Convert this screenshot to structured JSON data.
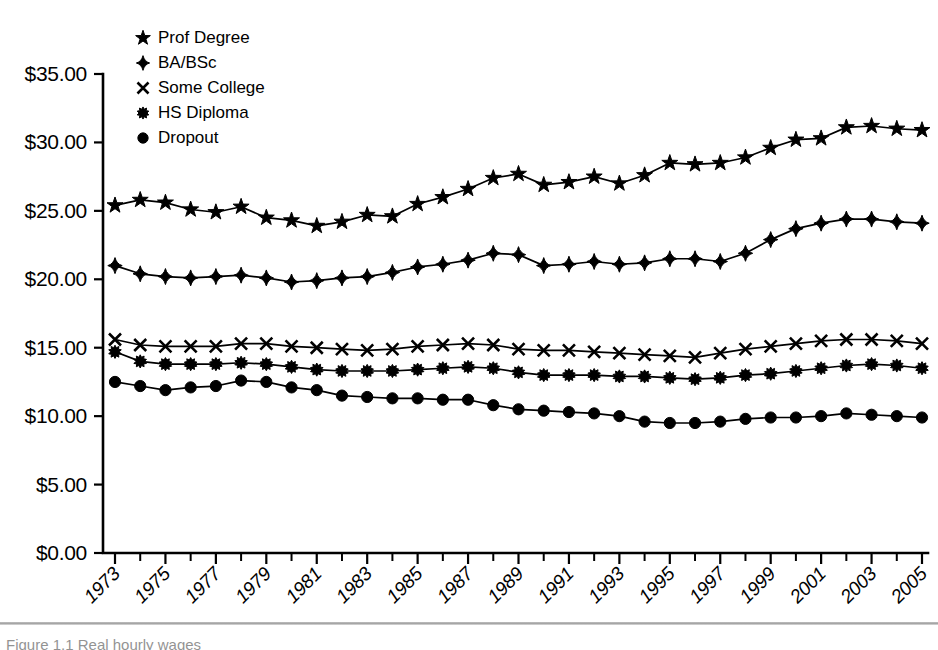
{
  "chart_data": {
    "type": "line",
    "title": "",
    "subtitle": "",
    "xlabel": "",
    "ylabel": "",
    "grid": false,
    "legend_position": "top-left",
    "ylim": [
      0,
      35
    ],
    "ytick_values": [
      0,
      5,
      10,
      15,
      20,
      25,
      30,
      35
    ],
    "ytick_labels": [
      "$0.00",
      "$5.00",
      "$10.00",
      "$15.00",
      "$20.00",
      "$25.00",
      "$30.00",
      "$35.00"
    ],
    "xlim": [
      1973,
      2005
    ],
    "x": [
      1973,
      1974,
      1975,
      1976,
      1977,
      1978,
      1979,
      1980,
      1981,
      1982,
      1983,
      1984,
      1985,
      1986,
      1987,
      1988,
      1989,
      1990,
      1991,
      1992,
      1993,
      1994,
      1995,
      1996,
      1997,
      1998,
      1999,
      2000,
      2001,
      2002,
      2003,
      2004,
      2005
    ],
    "xtick_labels": [
      "1973",
      "1975",
      "1977",
      "1979",
      "1981",
      "1983",
      "1985",
      "1987",
      "1989",
      "1991",
      "1993",
      "1995",
      "1997",
      "1999",
      "2001",
      "2003",
      "2005"
    ],
    "xtick_values": [
      1973,
      1975,
      1977,
      1979,
      1981,
      1983,
      1985,
      1987,
      1989,
      1991,
      1993,
      1995,
      1997,
      1999,
      2001,
      2003,
      2005
    ],
    "series": [
      {
        "name": "Prof Degree",
        "marker": "star",
        "values": [
          25.4,
          25.8,
          25.6,
          25.1,
          24.9,
          25.3,
          24.5,
          24.3,
          23.9,
          24.2,
          24.7,
          24.6,
          25.5,
          26.0,
          26.6,
          27.4,
          27.7,
          26.9,
          27.1,
          27.5,
          27.0,
          27.6,
          28.5,
          28.4,
          28.5,
          28.9,
          29.6,
          30.2,
          30.3,
          31.1,
          31.2,
          31.0,
          30.9
        ]
      },
      {
        "name": "BA/BSc",
        "marker": "diamond",
        "values": [
          21.0,
          20.4,
          20.2,
          20.1,
          20.2,
          20.3,
          20.1,
          19.8,
          19.9,
          20.1,
          20.2,
          20.5,
          20.9,
          21.1,
          21.4,
          21.9,
          21.8,
          21.0,
          21.1,
          21.3,
          21.1,
          21.2,
          21.5,
          21.5,
          21.3,
          21.9,
          22.9,
          23.7,
          24.1,
          24.4,
          24.4,
          24.2,
          24.1
        ]
      },
      {
        "name": "Some College",
        "marker": "x",
        "values": [
          15.6,
          15.2,
          15.1,
          15.1,
          15.1,
          15.3,
          15.3,
          15.1,
          15.0,
          14.9,
          14.8,
          14.9,
          15.1,
          15.2,
          15.3,
          15.2,
          14.9,
          14.8,
          14.8,
          14.7,
          14.6,
          14.5,
          14.4,
          14.3,
          14.6,
          14.9,
          15.1,
          15.3,
          15.5,
          15.6,
          15.6,
          15.5,
          15.3
        ]
      },
      {
        "name": "HS Diploma",
        "marker": "asterisk",
        "values": [
          14.7,
          14.0,
          13.8,
          13.8,
          13.8,
          13.9,
          13.8,
          13.6,
          13.4,
          13.3,
          13.3,
          13.3,
          13.4,
          13.5,
          13.6,
          13.5,
          13.2,
          13.0,
          13.0,
          13.0,
          12.9,
          12.9,
          12.8,
          12.7,
          12.8,
          13.0,
          13.1,
          13.3,
          13.5,
          13.7,
          13.8,
          13.7,
          13.5
        ]
      },
      {
        "name": "Dropout",
        "marker": "circle",
        "values": [
          12.5,
          12.2,
          11.9,
          12.1,
          12.2,
          12.6,
          12.5,
          12.1,
          11.9,
          11.5,
          11.4,
          11.3,
          11.3,
          11.2,
          11.2,
          10.8,
          10.5,
          10.4,
          10.3,
          10.2,
          10.0,
          9.6,
          9.5,
          9.5,
          9.6,
          9.8,
          9.9,
          9.9,
          10.0,
          10.2,
          10.1,
          10.0,
          9.9
        ]
      }
    ]
  },
  "legend": {
    "items": [
      {
        "label": "Prof Degree",
        "marker": "star"
      },
      {
        "label": "BA/BSc",
        "marker": "diamond"
      },
      {
        "label": "Some College",
        "marker": "x"
      },
      {
        "label": "HS Diploma",
        "marker": "asterisk"
      },
      {
        "label": "Dropout",
        "marker": "circle"
      }
    ]
  },
  "caption": {
    "text": "Figure 1.1  Real hourly wages"
  },
  "colors": {
    "ink": "#000000",
    "background": "#ffffff"
  }
}
